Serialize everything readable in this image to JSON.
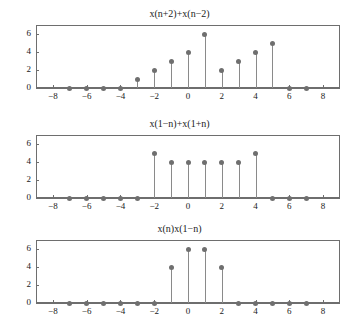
{
  "figure": {
    "background": "#ffffff",
    "marker_color": "#6f6f6f",
    "stem_color": "#8a8a8a",
    "axis_color": "#6e6e6e",
    "text_color": "#1a1a1a"
  },
  "chart_data": [
    {
      "type": "stem",
      "title": "x(n+2)+x(n−2)",
      "xlabel": "",
      "ylabel": "",
      "xlim": [
        -9,
        9
      ],
      "ylim": [
        0,
        7
      ],
      "xticks": [
        -8,
        -6,
        -4,
        -2,
        0,
        2,
        4,
        6,
        8
      ],
      "xticklabels": [
        "−8",
        "−6",
        "−4",
        "−2",
        "0",
        "2",
        "4",
        "6",
        "8"
      ],
      "yticks": [
        0,
        2,
        4,
        6
      ],
      "yticklabels": [
        "0",
        "2",
        "4",
        "6"
      ],
      "grid": false,
      "legend": "none",
      "x": [
        -7,
        -6,
        -5,
        -4,
        -3,
        -2,
        -1,
        0,
        1,
        2,
        3,
        4,
        5,
        6,
        7
      ],
      "values": [
        0,
        0,
        0,
        0,
        1,
        2,
        3,
        4,
        6,
        2,
        3,
        4,
        5,
        0,
        0
      ]
    },
    {
      "type": "stem",
      "title": "x(1−n)+x(1+n)",
      "xlabel": "",
      "ylabel": "",
      "xlim": [
        -9,
        9
      ],
      "ylim": [
        0,
        7
      ],
      "xticks": [
        -8,
        -6,
        -4,
        -2,
        0,
        2,
        4,
        6,
        8
      ],
      "xticklabels": [
        "−8",
        "−6",
        "−4",
        "−2",
        "0",
        "2",
        "4",
        "6",
        "8"
      ],
      "yticks": [
        0,
        2,
        4,
        6
      ],
      "yticklabels": [
        "0",
        "2",
        "4",
        "6"
      ],
      "grid": false,
      "legend": "none",
      "x": [
        -7,
        -6,
        -5,
        -4,
        -3,
        -2,
        -1,
        0,
        1,
        2,
        3,
        4,
        5,
        6,
        7
      ],
      "values": [
        0,
        0,
        0,
        0,
        0,
        5,
        4,
        4,
        4,
        4,
        4,
        5,
        0,
        0,
        0
      ]
    },
    {
      "type": "stem",
      "title": "x(n)x(1−n)",
      "xlabel": "",
      "ylabel": "",
      "xlim": [
        -9,
        9
      ],
      "ylim": [
        0,
        7
      ],
      "xticks": [
        -8,
        -6,
        -4,
        -2,
        0,
        2,
        4,
        6,
        8
      ],
      "xticklabels": [
        "−8",
        "−6",
        "−4",
        "−2",
        "0",
        "2",
        "4",
        "6",
        "8"
      ],
      "yticks": [
        0,
        2,
        4,
        6
      ],
      "yticklabels": [
        "0",
        "2",
        "4",
        "6"
      ],
      "grid": false,
      "legend": "none",
      "x": [
        -7,
        -6,
        -5,
        -4,
        -3,
        -2,
        -1,
        0,
        1,
        2,
        3,
        4,
        5,
        6,
        7
      ],
      "values": [
        0,
        0,
        0,
        0,
        0,
        0,
        4,
        6,
        6,
        4,
        0,
        0,
        0,
        0,
        0
      ]
    }
  ]
}
